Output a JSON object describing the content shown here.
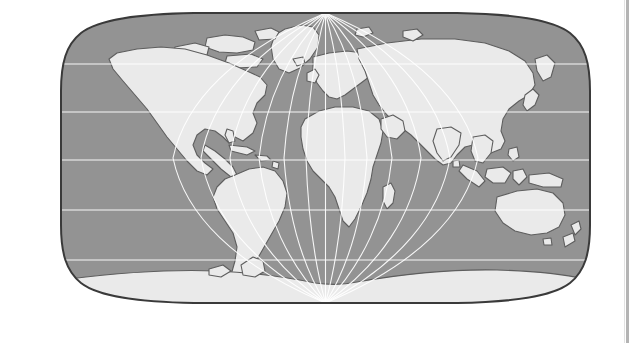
{
  "page": {
    "background_color": "#ffffff",
    "width": 635,
    "height": 343
  },
  "figure": {
    "kind": "world-map",
    "title": "",
    "caption": "",
    "projection": "Robinson (pseudocylindrical)",
    "frame": {
      "x": 57,
      "y": 11,
      "width": 537,
      "height": 294,
      "border_color": "#3a3a3a",
      "border_width": 2
    },
    "colors": {
      "ocean": "#939393",
      "land": "#eaeaea",
      "coastline": "#5e5e5e",
      "graticule": "#ffffff",
      "border": "#3a3a3a",
      "page_divider": "#b4b4b4"
    },
    "graticule": {
      "visible": true,
      "parallel_interval_degrees": 30,
      "meridian_interval_degrees": 30,
      "parallels": [
        60,
        30,
        0,
        -30,
        -60
      ],
      "meridians": [
        -180,
        -150,
        -120,
        -90,
        -60,
        -30,
        0,
        30,
        60,
        90,
        120,
        150,
        180
      ],
      "line_color": "#ffffff",
      "line_width": 1.1
    },
    "extent": {
      "lon_min": -180,
      "lon_max": 180,
      "lat_min": -90,
      "lat_max": 90
    },
    "landmasses": [
      "North America",
      "South America",
      "Africa",
      "Europe",
      "Asia",
      "Australia",
      "Antarctica",
      "Greenland",
      "Madagascar",
      "Japan",
      "New Zealand",
      "Indonesia",
      "British Isles",
      "Iceland",
      "Arctic Archipelago"
    ]
  },
  "divider": {
    "name": "page-edge-rule",
    "color": "#b4b4b4"
  }
}
